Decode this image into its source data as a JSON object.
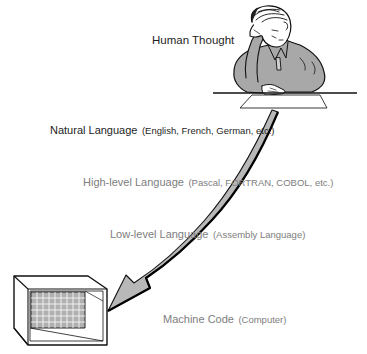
{
  "diagram": {
    "type": "language-abstraction-levels",
    "levels": [
      {
        "id": "human",
        "label": "Human Thought",
        "detail": ""
      },
      {
        "id": "natural",
        "label": "Natural Language",
        "detail": "(English, French, German, etc.)"
      },
      {
        "id": "high",
        "label": "High-level Language",
        "detail": "(Pascal, FORTRAN, COBOL, etc.)"
      },
      {
        "id": "low",
        "label": "Low-level Language",
        "detail": "(Assembly Language)"
      },
      {
        "id": "machine",
        "label": "Machine Code",
        "detail": "(Computer)"
      }
    ],
    "icons": {
      "top": "thinking-person-at-desk",
      "bottom": "computer-box-with-grid-screen",
      "flow": "curved-arrow-down-left"
    },
    "colors": {
      "dark_text": "#1e1e1e",
      "light_text": "#7d7d7d",
      "arrow_fill": "#b8b8b8",
      "shirt_fill": "#a8a8a8",
      "screen_fill": "#b0b0b0"
    }
  }
}
